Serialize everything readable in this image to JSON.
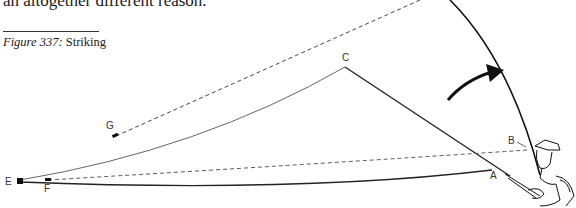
{
  "page": {
    "body_text_fragment": "an altogether different reason.",
    "caption": {
      "figure_label": "Figure 337:",
      "title": "Striking"
    }
  },
  "diagram": {
    "point_labels": {
      "A": "A",
      "B": "B",
      "C": "C",
      "E": "E",
      "F": "F",
      "G": "G"
    },
    "elements": [
      "rod-at-rest (butt to A)",
      "rod-raised curved (to top right)",
      "line E→C→rod tip (solid thin)",
      "line E→A (solid)",
      "line F→B (dashed)",
      "line G→top (dashed)",
      "strike-direction arrow",
      "angler figure with hat and bag"
    ]
  }
}
